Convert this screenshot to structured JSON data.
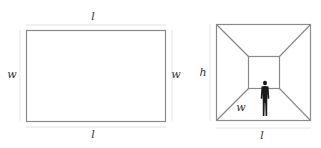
{
  "diagram": {
    "left": {
      "description": "Floor plan rectangle",
      "top_label": "l",
      "bottom_label": "l",
      "left_label": "w",
      "right_label": "w"
    },
    "right": {
      "description": "Room perspective with human figure",
      "height_label": "h",
      "width_label": "w",
      "length_label": "l"
    },
    "colors": {
      "outline": "#8a8a8a",
      "dimension_line": "#e2e2e2",
      "figure": "#1a1a1a",
      "text": "#333333"
    }
  }
}
